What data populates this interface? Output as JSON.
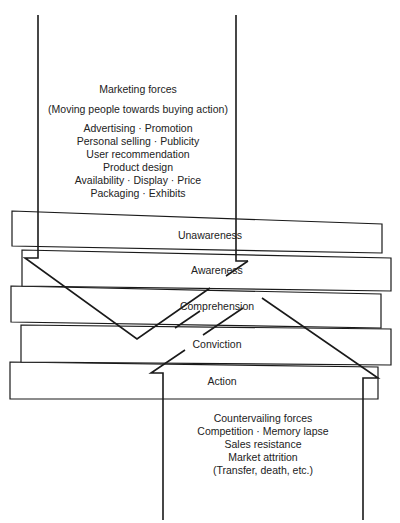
{
  "marketing_forces": {
    "title": "Marketing forces",
    "subtitle": "(Moving people towards buying action)",
    "items": [
      "Advertising · Promotion",
      "Personal selling · Publicity",
      "User recommendation",
      "Product design",
      "Availability · Display · Price",
      "Packaging · Exhibits"
    ]
  },
  "stages": [
    {
      "label": "Unawareness"
    },
    {
      "label": "Awareness"
    },
    {
      "label": "Comprehension"
    },
    {
      "label": "Conviction"
    },
    {
      "label": "Action"
    }
  ],
  "countervailing_forces": {
    "title": "Countervailing forces",
    "items": [
      "Competition · Memory lapse",
      "Sales resistance",
      "Market attrition",
      "(Transfer, death, etc.)"
    ]
  },
  "colors": {
    "line": "#1a1a1a",
    "background": "#ffffff"
  }
}
